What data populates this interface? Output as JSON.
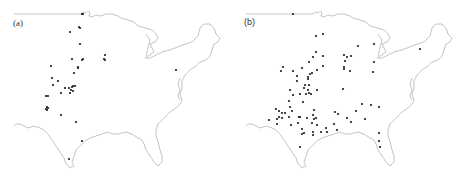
{
  "figure": {
    "panels": [
      {
        "id": "a",
        "label": "(a)",
        "description": "Eastern/central United States outline with sparse point locations concentrated in the Great Plains",
        "point_color": "#1a1a1a",
        "outline_color": "#b5b5b5",
        "points": [
          [
            82,
            14
          ],
          [
            83,
            14
          ],
          [
            70,
            32
          ],
          [
            79,
            27
          ],
          [
            80,
            28
          ],
          [
            80,
            44
          ],
          [
            72,
            59
          ],
          [
            82,
            60
          ],
          [
            83,
            59
          ],
          [
            105,
            55
          ],
          [
            104,
            59
          ],
          [
            105,
            60
          ],
          [
            51,
            66
          ],
          [
            78,
            67
          ],
          [
            78,
            68
          ],
          [
            74,
            73
          ],
          [
            52,
            78
          ],
          [
            58,
            81
          ],
          [
            53,
            85
          ],
          [
            65,
            88
          ],
          [
            69,
            88
          ],
          [
            72,
            87
          ],
          [
            73,
            86
          ],
          [
            75,
            86
          ],
          [
            71,
            90
          ],
          [
            70,
            93
          ],
          [
            73,
            91
          ],
          [
            61,
            93
          ],
          [
            46,
            96
          ],
          [
            48,
            96
          ],
          [
            47,
            107
          ],
          [
            47,
            110
          ],
          [
            46,
            109
          ],
          [
            48,
            108
          ],
          [
            61,
            115
          ],
          [
            76,
            122
          ],
          [
            82,
            141
          ],
          [
            69,
            159
          ],
          [
            176,
            70
          ]
        ]
      },
      {
        "id": "b",
        "label": "(b)",
        "description": "Eastern/central United States outline with denser point locations across the Plains, Midwest and Southeast",
        "point_color": "#1a1a1a",
        "outline_color": "#b5b5b5",
        "points": [
          [
            61,
            14
          ],
          [
            84,
            36
          ],
          [
            91,
            34
          ],
          [
            126,
            46
          ],
          [
            142,
            44
          ],
          [
            84,
            52
          ],
          [
            91,
            56
          ],
          [
            81,
            57
          ],
          [
            77,
            62
          ],
          [
            112,
            55
          ],
          [
            115,
            57
          ],
          [
            119,
            56
          ],
          [
            113,
            61
          ],
          [
            142,
            62
          ],
          [
            51,
            67
          ],
          [
            49,
            71
          ],
          [
            61,
            71
          ],
          [
            70,
            68
          ],
          [
            91,
            66
          ],
          [
            85,
            70
          ],
          [
            112,
            67
          ],
          [
            112,
            69
          ],
          [
            118,
            71
          ],
          [
            141,
            72
          ],
          [
            188,
            49
          ],
          [
            65,
            76
          ],
          [
            76,
            77
          ],
          [
            78,
            74
          ],
          [
            80,
            73
          ],
          [
            76,
            79
          ],
          [
            65,
            81
          ],
          [
            73,
            85
          ],
          [
            77,
            85
          ],
          [
            58,
            90
          ],
          [
            85,
            90
          ],
          [
            72,
            88
          ],
          [
            76,
            90
          ],
          [
            74,
            94
          ],
          [
            77,
            93
          ],
          [
            79,
            94
          ],
          [
            68,
            94
          ],
          [
            61,
            95
          ],
          [
            111,
            89
          ],
          [
            57,
            101
          ],
          [
            71,
            102
          ],
          [
            58,
            107
          ],
          [
            130,
            104
          ],
          [
            139,
            105
          ],
          [
            147,
            107
          ],
          [
            44,
            109
          ],
          [
            47,
            111
          ],
          [
            50,
            113
          ],
          [
            53,
            113
          ],
          [
            60,
            111
          ],
          [
            82,
            110
          ],
          [
            81,
            115
          ],
          [
            103,
            112
          ],
          [
            106,
            114
          ],
          [
            124,
            111
          ],
          [
            47,
            117
          ],
          [
            50,
            118
          ],
          [
            45,
            119
          ],
          [
            57,
            117
          ],
          [
            67,
            117
          ],
          [
            68,
            117
          ],
          [
            75,
            118
          ],
          [
            82,
            119
          ],
          [
            84,
            118
          ],
          [
            37,
            120
          ],
          [
            45,
            124
          ],
          [
            59,
            125
          ],
          [
            66,
            123
          ],
          [
            80,
            123
          ],
          [
            85,
            125
          ],
          [
            115,
            118
          ],
          [
            102,
            124
          ],
          [
            119,
            122
          ],
          [
            133,
            119
          ],
          [
            70,
            129
          ],
          [
            72,
            133
          ],
          [
            70,
            134
          ],
          [
            81,
            132
          ],
          [
            81,
            135
          ],
          [
            94,
            128
          ],
          [
            95,
            132
          ],
          [
            89,
            132
          ],
          [
            105,
            130
          ],
          [
            147,
            133
          ],
          [
            147,
            141
          ],
          [
            148,
            147
          ],
          [
            68,
            147
          ]
        ]
      }
    ]
  }
}
